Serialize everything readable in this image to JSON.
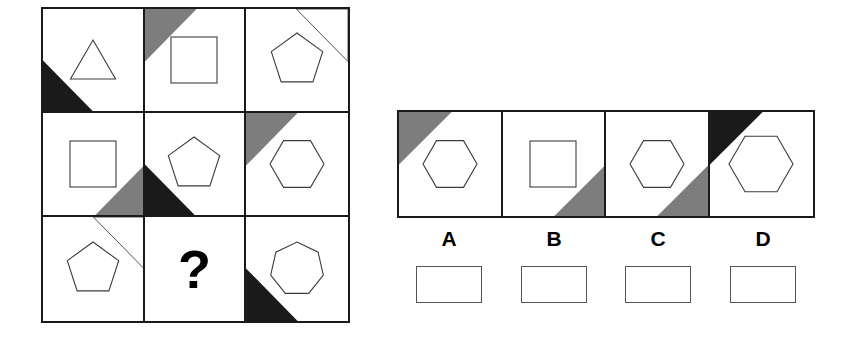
{
  "puzzle": {
    "type": "visual-analogy-matrix",
    "question_mark": "?",
    "colors": {
      "black": "#1a1a1a",
      "gray": "#7d7d7d",
      "white": "#ffffff",
      "outline": "#3c3c3c"
    },
    "matrix": {
      "rows": 3,
      "cols": 3,
      "cells": [
        {
          "id": "cell-1",
          "row": 1,
          "col": 1,
          "shape": "triangle",
          "sides": 3,
          "corner": {
            "position": "bottom-left",
            "fill": "black"
          }
        },
        {
          "id": "cell-2",
          "row": 1,
          "col": 2,
          "shape": "square",
          "sides": 4,
          "corner": {
            "position": "top-left",
            "fill": "gray"
          }
        },
        {
          "id": "cell-3",
          "row": 1,
          "col": 3,
          "shape": "pentagon",
          "sides": 5,
          "corner": {
            "position": "top-right",
            "fill": "white"
          }
        },
        {
          "id": "cell-4",
          "row": 2,
          "col": 1,
          "shape": "square",
          "sides": 4,
          "corner": {
            "position": "bottom-right",
            "fill": "gray"
          }
        },
        {
          "id": "cell-5",
          "row": 2,
          "col": 2,
          "shape": "pentagon",
          "sides": 5,
          "corner": {
            "position": "bottom-left",
            "fill": "black"
          }
        },
        {
          "id": "cell-6",
          "row": 2,
          "col": 3,
          "shape": "hexagon",
          "sides": 6,
          "corner": {
            "position": "top-left",
            "fill": "gray"
          }
        },
        {
          "id": "cell-7",
          "row": 3,
          "col": 1,
          "shape": "pentagon",
          "sides": 5,
          "corner": {
            "position": "top-right",
            "fill": "white"
          }
        },
        {
          "id": "cell-8",
          "row": 3,
          "col": 2,
          "shape": "question",
          "sides": 0,
          "corner": {
            "position": "none",
            "fill": "none"
          }
        },
        {
          "id": "cell-9",
          "row": 3,
          "col": 3,
          "shape": "heptagon",
          "sides": 7,
          "corner": {
            "position": "bottom-left",
            "fill": "black"
          }
        }
      ]
    },
    "options": [
      {
        "id": "option-a",
        "label": "A",
        "shape": "hexagon",
        "sides": 6,
        "size": "medium",
        "corner": {
          "position": "top-left",
          "fill": "gray"
        }
      },
      {
        "id": "option-b",
        "label": "B",
        "shape": "square",
        "sides": 4,
        "size": "medium",
        "corner": {
          "position": "bottom-right",
          "fill": "gray"
        }
      },
      {
        "id": "option-c",
        "label": "C",
        "shape": "hexagon",
        "sides": 6,
        "size": "medium",
        "corner": {
          "position": "bottom-right",
          "fill": "gray"
        }
      },
      {
        "id": "option-d",
        "label": "D",
        "shape": "hexagon",
        "sides": 6,
        "size": "large",
        "corner": {
          "position": "top-left",
          "fill": "black"
        }
      }
    ],
    "answer_boxes": [
      {
        "id": "answer-box-a",
        "label": "A",
        "value": ""
      },
      {
        "id": "answer-box-b",
        "label": "B",
        "value": ""
      },
      {
        "id": "answer-box-c",
        "label": "C",
        "value": ""
      },
      {
        "id": "answer-box-d",
        "label": "D",
        "value": ""
      }
    ]
  }
}
